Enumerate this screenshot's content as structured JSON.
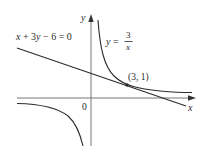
{
  "figure": {
    "type": "function graph",
    "axes": {
      "x_label": "x",
      "y_label": "y",
      "origin_label": "0"
    },
    "curves": [
      {
        "name": "tangent-line",
        "equation_label_parts": [
          "x",
          " + 3",
          "y",
          " − 6 = 0"
        ],
        "equation": "x + 3y - 6 = 0"
      },
      {
        "name": "hyperbola",
        "equation_lhs": "y =",
        "fraction_numerator": "3",
        "fraction_denominator": "x",
        "equation": "y = 3/x"
      }
    ],
    "point": {
      "label": "(3, 1)",
      "x": 3,
      "y": 1
    },
    "colors": {
      "stroke": "#2a2a2a",
      "axis": "#555555",
      "background": "#ffffff"
    }
  }
}
